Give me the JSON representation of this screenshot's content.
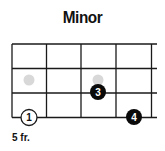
{
  "chord": {
    "title": "Minor",
    "fret_label": "5 fr.",
    "strings": 5,
    "frets": 3,
    "dots": [
      {
        "string": 0,
        "fret": 3,
        "label": "1",
        "style": "open"
      },
      {
        "string": 2,
        "fret": 2,
        "label": "3",
        "style": "filled"
      },
      {
        "string": 3,
        "fret": 3,
        "label": "4",
        "style": "filled"
      }
    ],
    "ghost_dots": [
      {
        "string": 0,
        "fret": 2
      },
      {
        "string": 2,
        "fret": 2
      }
    ],
    "colors": {
      "line": "#1a1a1a",
      "filled": "#0a0a0a",
      "ghost": "#d8d8d8",
      "text_on_filled": "#ffffff"
    }
  }
}
